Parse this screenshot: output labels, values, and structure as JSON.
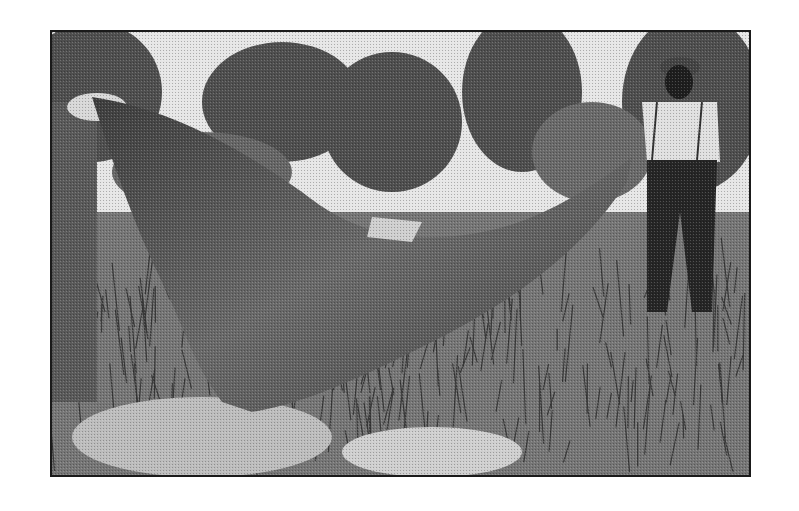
{
  "photo": {
    "description": "Vintage black-and-white photograph of two men outdoors holding up a large stretched animal hide among tall grass and trees",
    "style": "grayscale halftone",
    "colors": {
      "background": "#ffffff",
      "frame": "#1a1a1a",
      "sky": "#e8e8e8",
      "foliage": "#555555",
      "hide": "#5a5a5a",
      "grass": "#7a7a7a",
      "shirt": "#e0e0e0",
      "trousers": "#2a2a2a"
    }
  }
}
